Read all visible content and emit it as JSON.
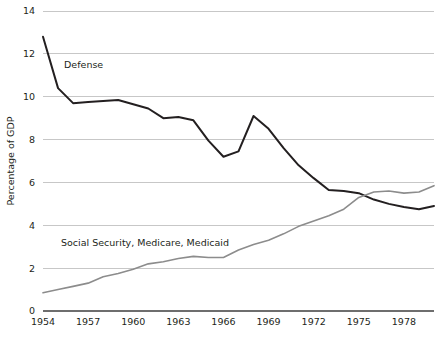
{
  "chart_data": {
    "type": "line",
    "title": "",
    "xlabel": "",
    "ylabel": "Percentage of GDP",
    "xlim": [
      1954,
      1980
    ],
    "ylim": [
      0,
      14
    ],
    "grid": true,
    "legend_position": "inline-annotation",
    "y_ticks": [
      0,
      2,
      4,
      6,
      8,
      10,
      12,
      14
    ],
    "y_tick_labels": [
      "0",
      "2",
      "4",
      "6",
      "8",
      "10",
      "12",
      "14"
    ],
    "x_ticks": [
      1954,
      1957,
      1960,
      1963,
      1966,
      1969,
      1972,
      1975,
      1978
    ],
    "x_tick_labels": [
      "1954",
      "1957",
      "1960",
      "1963",
      "1966",
      "1969",
      "1972",
      "1975",
      "1978"
    ],
    "x": [
      1954,
      1955,
      1956,
      1957,
      1958,
      1959,
      1960,
      1961,
      1962,
      1963,
      1964,
      1965,
      1966,
      1967,
      1968,
      1969,
      1970,
      1971,
      1972,
      1973,
      1974,
      1975,
      1976,
      1977,
      1978,
      1979,
      1980
    ],
    "series": [
      {
        "name": "Defense",
        "color": "#231f20",
        "width": 2.0,
        "label_x": 1955.4,
        "label_y": 11.35,
        "values": [
          12.8,
          10.4,
          9.7,
          9.75,
          9.8,
          9.85,
          9.65,
          9.45,
          9.0,
          9.05,
          8.9,
          7.95,
          7.2,
          7.45,
          9.1,
          8.5,
          7.6,
          6.8,
          6.2,
          5.65,
          5.6,
          5.5,
          5.2,
          5.0,
          4.85,
          4.75,
          4.9
        ]
      },
      {
        "name": "Social Security, Medicare, Medicaid",
        "color": "#8c8c8c",
        "width": 1.6,
        "label_x": 1955.2,
        "label_y": 3.05,
        "values": [
          0.85,
          1.0,
          1.15,
          1.3,
          1.6,
          1.75,
          1.95,
          2.2,
          2.3,
          2.45,
          2.55,
          2.5,
          2.5,
          2.85,
          3.1,
          3.3,
          3.6,
          3.95,
          4.2,
          4.45,
          4.75,
          5.3,
          5.55,
          5.6,
          5.5,
          5.55,
          5.85
        ]
      }
    ]
  },
  "chart_style": {
    "grid_color": "#b9b9b9",
    "axis_color": "#6e6e6e",
    "background": "#ffffff"
  }
}
